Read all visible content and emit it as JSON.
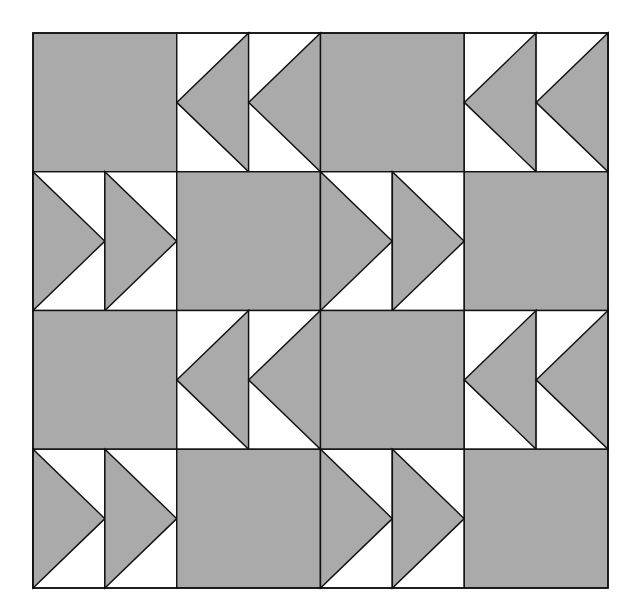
{
  "diagram": {
    "type": "quilt-block-layout",
    "pattern": "flying-geese",
    "grid": {
      "rows": 4,
      "cols": 4,
      "x0": 33,
      "y0": 33,
      "x1": 608,
      "y1": 588
    },
    "colors": {
      "fill": "#aaaaaa",
      "background": "#ffffff",
      "stroke": "#111111"
    },
    "rows": [
      [
        "square",
        "geese-left",
        "square",
        "geese-left"
      ],
      [
        "geese-right",
        "square",
        "geese-right",
        "square"
      ],
      [
        "square",
        "geese-left",
        "square",
        "geese-left"
      ],
      [
        "geese-right",
        "square",
        "geese-right",
        "square"
      ]
    ]
  }
}
